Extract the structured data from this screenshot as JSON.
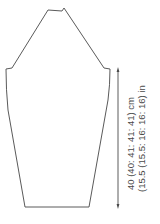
{
  "diagram": {
    "type": "sleeve-schematic",
    "outline_color": "#5a5a5a",
    "arrow_color": "#4a4a4a",
    "measurements": {
      "length_cm": "40 (40: 41: 41: 41) cm",
      "length_in": "(15.5 (15.5: 16: 16: 16) in"
    }
  }
}
